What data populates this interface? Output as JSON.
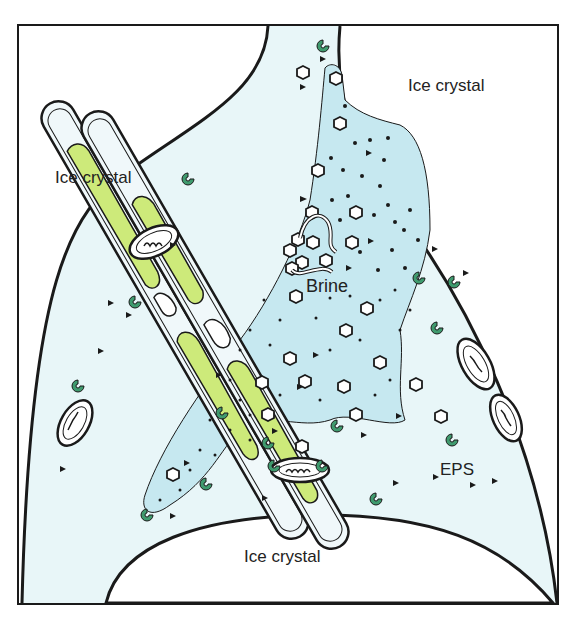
{
  "diagram": {
    "labels": {
      "ice_top_right": "Ice crystal",
      "ice_left": "Ice crystal",
      "ice_bottom": "Ice crystal",
      "brine": "Brine",
      "eps": "EPS"
    },
    "colors": {
      "brine_channel": "#e8f6f8",
      "brine_pocket": "#c6e8f0",
      "chloroplast": "#cdea7a",
      "bacteria": "#3f9a6e",
      "outline": "#1a1a1a"
    }
  }
}
